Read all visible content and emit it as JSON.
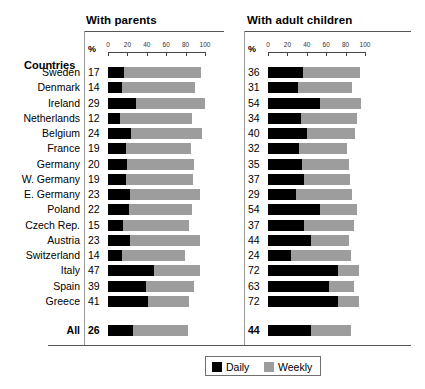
{
  "panels": [
    {
      "key": "parents",
      "title": "With parents",
      "axis_unit": "%"
    },
    {
      "key": "children",
      "title": "With adult children",
      "axis_unit": "%"
    }
  ],
  "row_header": "Countries",
  "total_row_label": "All",
  "axis": {
    "unit_label": "%",
    "ticks": [
      0,
      20,
      40,
      60,
      80,
      100
    ],
    "min": 0,
    "max": 100
  },
  "legend": {
    "daily_label": "Daily",
    "weekly_label": "Weekly",
    "daily_color": "#000000",
    "weekly_color": "#9d9d9d"
  },
  "chart_data": {
    "type": "bar",
    "xlabel": "%",
    "ylabel": "Countries",
    "xlim": [
      0,
      100
    ],
    "grid": false,
    "orientation": "horizontal",
    "stacked": true,
    "legend_position": "bottom-center",
    "panels": [
      "With parents",
      "With adult children"
    ],
    "series": [
      {
        "name": "Daily",
        "color": "#000000"
      },
      {
        "name": "Weekly",
        "color": "#9d9d9d"
      }
    ],
    "categories": [
      "Sweden",
      "Denmark",
      "Ireland",
      "Netherlands",
      "Belgium",
      "France",
      "Germany",
      "W. Germany",
      "E. Germany",
      "Poland",
      "Czech Rep.",
      "Austria",
      "Switzerland",
      "Italy",
      "Spain",
      "Greece",
      "All"
    ],
    "with_parents": {
      "daily": [
        17,
        14,
        29,
        12,
        24,
        19,
        20,
        19,
        23,
        22,
        15,
        23,
        14,
        47,
        39,
        41,
        26
      ],
      "weekly": [
        79,
        76,
        71,
        75,
        73,
        67,
        69,
        69,
        72,
        65,
        68,
        72,
        65,
        48,
        50,
        43,
        56
      ],
      "total": [
        96,
        90,
        100,
        87,
        97,
        86,
        89,
        88,
        95,
        87,
        83,
        95,
        79,
        95,
        89,
        84,
        82
      ]
    },
    "with_adult_children": {
      "daily": [
        36,
        31,
        54,
        34,
        40,
        32,
        35,
        37,
        29,
        54,
        37,
        44,
        24,
        72,
        63,
        72,
        44
      ],
      "weekly": [
        59,
        56,
        42,
        58,
        50,
        49,
        48,
        48,
        58,
        38,
        52,
        39,
        62,
        22,
        26,
        22,
        42
      ],
      "total": [
        95,
        87,
        96,
        92,
        90,
        81,
        83,
        85,
        87,
        92,
        89,
        83,
        86,
        94,
        89,
        94,
        86
      ]
    }
  },
  "rows": [
    {
      "label": "Sweden",
      "parents": {
        "value": "17",
        "daily": 17,
        "total": 96
      },
      "children": {
        "value": "36",
        "daily": 36,
        "total": 95
      }
    },
    {
      "label": "Denmark",
      "parents": {
        "value": "14",
        "daily": 14,
        "total": 90
      },
      "children": {
        "value": "31",
        "daily": 31,
        "total": 87
      }
    },
    {
      "label": "Ireland",
      "parents": {
        "value": "29",
        "daily": 29,
        "total": 100
      },
      "children": {
        "value": "54",
        "daily": 54,
        "total": 96
      }
    },
    {
      "label": "Netherlands",
      "parents": {
        "value": "12",
        "daily": 12,
        "total": 87
      },
      "children": {
        "value": "34",
        "daily": 34,
        "total": 92
      }
    },
    {
      "label": "Belgium",
      "parents": {
        "value": "24",
        "daily": 24,
        "total": 97
      },
      "children": {
        "value": "40",
        "daily": 40,
        "total": 90
      }
    },
    {
      "label": "France",
      "parents": {
        "value": "19",
        "daily": 19,
        "total": 86
      },
      "children": {
        "value": "32",
        "daily": 32,
        "total": 81
      }
    },
    {
      "label": "Germany",
      "parents": {
        "value": "20",
        "daily": 20,
        "total": 89
      },
      "children": {
        "value": "35",
        "daily": 35,
        "total": 83
      }
    },
    {
      "label": "W. Germany",
      "parents": {
        "value": "19",
        "daily": 19,
        "total": 88
      },
      "children": {
        "value": "37",
        "daily": 37,
        "total": 85
      }
    },
    {
      "label": "E. Germany",
      "parents": {
        "value": "23",
        "daily": 23,
        "total": 95
      },
      "children": {
        "value": "29",
        "daily": 29,
        "total": 87
      }
    },
    {
      "label": "Poland",
      "parents": {
        "value": "22",
        "daily": 22,
        "total": 87
      },
      "children": {
        "value": "54",
        "daily": 54,
        "total": 92
      }
    },
    {
      "label": "Czech Rep.",
      "parents": {
        "value": "15",
        "daily": 15,
        "total": 83
      },
      "children": {
        "value": "37",
        "daily": 37,
        "total": 89
      }
    },
    {
      "label": "Austria",
      "parents": {
        "value": "23",
        "daily": 23,
        "total": 95
      },
      "children": {
        "value": "44",
        "daily": 44,
        "total": 83
      }
    },
    {
      "label": "Switzerland",
      "parents": {
        "value": "14",
        "daily": 14,
        "total": 79
      },
      "children": {
        "value": "24",
        "daily": 24,
        "total": 86
      }
    },
    {
      "label": "Italy",
      "parents": {
        "value": "47",
        "daily": 47,
        "total": 95
      },
      "children": {
        "value": "72",
        "daily": 72,
        "total": 94
      }
    },
    {
      "label": "Spain",
      "parents": {
        "value": "39",
        "daily": 39,
        "total": 89
      },
      "children": {
        "value": "63",
        "daily": 63,
        "total": 89
      }
    },
    {
      "label": "Greece",
      "parents": {
        "value": "41",
        "daily": 41,
        "total": 84
      },
      "children": {
        "value": "72",
        "daily": 72,
        "total": 94
      }
    }
  ],
  "total_row": {
    "label": "All",
    "parents": {
      "value": "26",
      "daily": 26,
      "total": 82
    },
    "children": {
      "value": "44",
      "daily": 44,
      "total": 86
    }
  }
}
